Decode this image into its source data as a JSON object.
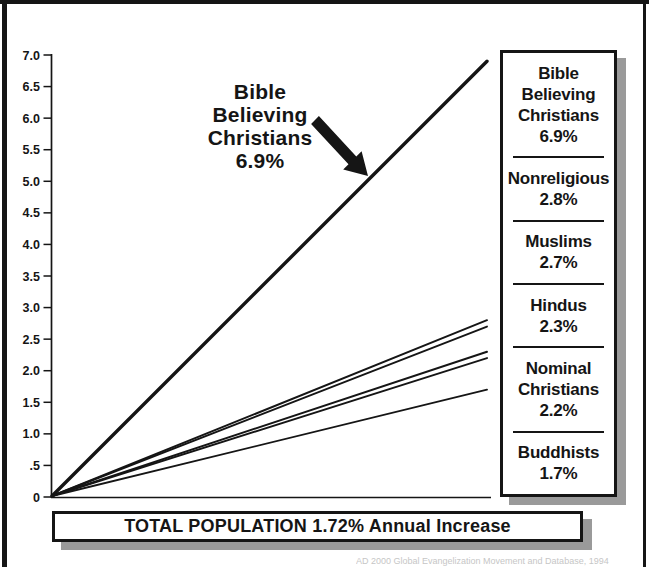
{
  "page": {
    "background": "#ffffff",
    "ink": "#151515",
    "shadow_gray": "#9a9a9a"
  },
  "chart_data": {
    "type": "line",
    "title": "",
    "xlabel": "",
    "ylabel": "",
    "ylim": [
      0,
      7.0
    ],
    "ytick_labels": [
      "7.0",
      "6.5",
      "6.0",
      "5.5",
      "5.0",
      "4.5",
      "4.0",
      "3.5",
      "3.0",
      "2.5",
      "2.0",
      "1.5",
      "1.0",
      ".5",
      "0"
    ],
    "grid": false,
    "legend_position": "right",
    "x_normalized": [
      0,
      1
    ],
    "series": [
      {
        "name": "Bible Believing Christians",
        "annual_increase_percent": 6.9,
        "values": [
          0,
          6.9
        ],
        "emphasis": true
      },
      {
        "name": "Nonreligious",
        "annual_increase_percent": 2.8,
        "values": [
          0,
          2.8
        ],
        "emphasis": false
      },
      {
        "name": "Muslims",
        "annual_increase_percent": 2.7,
        "values": [
          0,
          2.7
        ],
        "emphasis": false
      },
      {
        "name": "Hindus",
        "annual_increase_percent": 2.3,
        "values": [
          0,
          2.3
        ],
        "emphasis": false
      },
      {
        "name": "Nominal Christians",
        "annual_increase_percent": 2.2,
        "values": [
          0,
          2.2
        ],
        "emphasis": false
      },
      {
        "name": "Buddhists",
        "annual_increase_percent": 1.7,
        "values": [
          0,
          1.7
        ],
        "emphasis": false
      }
    ]
  },
  "annotation": {
    "text": "Bible\nBelieving\nChristians\n6.9%"
  },
  "legend": {
    "entries": [
      {
        "label": "Bible Believing Christians",
        "value": "6.9%"
      },
      {
        "label": "Nonreligious",
        "value": "2.8%"
      },
      {
        "label": "Muslims",
        "value": "2.7%"
      },
      {
        "label": "Hindus",
        "value": "2.3%"
      },
      {
        "label": "Nominal Christians",
        "value": "2.2%"
      },
      {
        "label": "Buddhists",
        "value": "1.7%"
      }
    ]
  },
  "footer": {
    "bar_text": "TOTAL POPULATION 1.72% Annual Increase",
    "caption": "AD 2000 Global Evangelization Movement and Database, 1994"
  }
}
